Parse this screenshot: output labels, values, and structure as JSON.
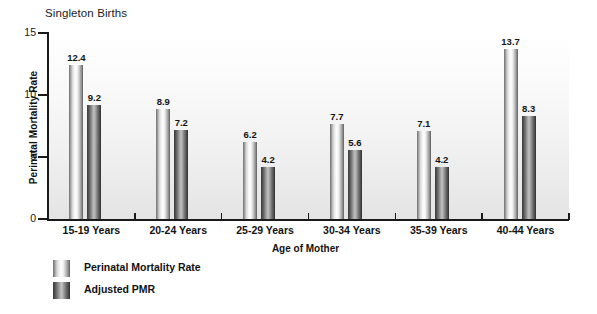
{
  "chart_data": {
    "type": "bar",
    "title": "Singleton Births",
    "xlabel": "Age of Mother",
    "ylabel": "Perinatal Mortality Rate",
    "categories": [
      "15-19 Years",
      "20-24 Years",
      "25-29 Years",
      "30-34 Years",
      "35-39 Years",
      "40-44 Years"
    ],
    "series": [
      {
        "name": "Perinatal Mortality Rate",
        "values": [
          12.4,
          8.9,
          6.2,
          7.7,
          7.1,
          13.7
        ],
        "style": "light-gradient"
      },
      {
        "name": "Adjusted PMR",
        "values": [
          9.2,
          7.2,
          4.2,
          5.6,
          4.2,
          8.3
        ],
        "style": "dark-gradient"
      }
    ],
    "ylim": [
      0,
      15
    ],
    "yticks": [
      0,
      5,
      10,
      15
    ],
    "ytick_labels": [
      "0",
      "5",
      "10",
      "15"
    ],
    "grid": false,
    "legend_position": "below-left",
    "data_labels": true
  },
  "colors": {
    "axis": "#1a1a1a",
    "text": "#111111",
    "plot_background_top": "#ffffff",
    "plot_background_bottom": "#e4e4e4",
    "series_light": "#d8d8d8",
    "series_dark": "#4e4e4e"
  }
}
